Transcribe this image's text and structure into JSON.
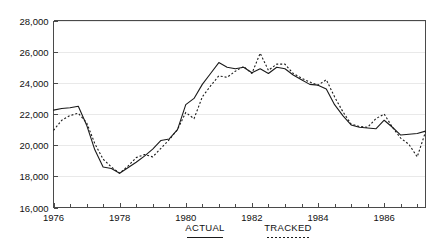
{
  "chart_data": {
    "type": "line",
    "title": "",
    "xlabel": "",
    "ylabel": "",
    "ylim": [
      16000,
      28000
    ],
    "xlim": [
      1976.0,
      1987.25
    ],
    "ytick_labels": [
      "28,000",
      "26,000",
      "24,000",
      "22,000",
      "20,000",
      "18,000",
      "16,000"
    ],
    "ytick_values": [
      28000,
      26000,
      24000,
      22000,
      20000,
      18000,
      16000
    ],
    "xtick_labels": [
      "1976",
      "1978",
      "1980",
      "1982",
      "1984",
      "1986"
    ],
    "xtick_values": [
      1976,
      1978,
      1980,
      1982,
      1984,
      1986
    ],
    "xtick_minor_step": 0.5,
    "grid": true,
    "grid_axis": "y",
    "legend_position": "below-center",
    "legend": [
      {
        "name": "ACTUAL",
        "style": "solid"
      },
      {
        "name": "TRACKED",
        "style": "dotted"
      }
    ],
    "x": [
      1976.0,
      1976.25,
      1976.5,
      1976.75,
      1977.0,
      1977.25,
      1977.5,
      1977.75,
      1978.0,
      1978.25,
      1978.5,
      1978.75,
      1979.0,
      1979.25,
      1979.5,
      1979.75,
      1980.0,
      1980.25,
      1980.5,
      1980.75,
      1981.0,
      1981.25,
      1981.5,
      1981.75,
      1982.0,
      1982.25,
      1982.5,
      1982.75,
      1983.0,
      1983.25,
      1983.5,
      1983.75,
      1984.0,
      1984.25,
      1984.5,
      1984.75,
      1985.0,
      1985.25,
      1985.5,
      1985.75,
      1986.0,
      1986.25,
      1986.5,
      1986.75,
      1987.0,
      1987.25
    ],
    "series": [
      {
        "name": "ACTUAL",
        "style": "solid",
        "values": [
          22250,
          22350,
          22400,
          22500,
          21300,
          19700,
          18600,
          18500,
          18200,
          18550,
          18900,
          19300,
          19750,
          20300,
          20400,
          21000,
          22600,
          23000,
          23900,
          24600,
          25300,
          25000,
          24900,
          25000,
          24650,
          24900,
          24600,
          25000,
          24900,
          24500,
          24200,
          23900,
          23850,
          23600,
          22600,
          21900,
          21300,
          21150,
          21100,
          21050,
          21600,
          21150,
          20650,
          20700,
          20750,
          20900
        ]
      },
      {
        "name": "TRACKED",
        "style": "dotted",
        "values": [
          20950,
          21600,
          21900,
          22050,
          21450,
          20100,
          19100,
          18600,
          18200,
          18650,
          19200,
          19400,
          19250,
          19800,
          20350,
          21000,
          22100,
          21700,
          23100,
          23800,
          24450,
          24350,
          24750,
          25050,
          24600,
          25900,
          24800,
          25200,
          25200,
          24600,
          24300,
          24050,
          23850,
          24200,
          23100,
          22150,
          21350,
          21200,
          21150,
          21700,
          22000,
          21150,
          20450,
          20050,
          19250,
          20850
        ]
      }
    ]
  }
}
